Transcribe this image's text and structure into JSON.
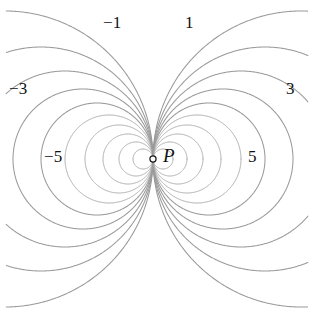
{
  "figure": {
    "type": "contour-diagram",
    "width": 314,
    "height": 316,
    "background_color": "#ffffff",
    "curve_color": "#9a9a9a",
    "label_color": "#111111"
  },
  "point": {
    "label": "P",
    "marker": "open-circle",
    "x": 153,
    "y": 159
  },
  "labels": [
    {
      "text": "−1",
      "x": 103,
      "y": 14,
      "name": "contour-label-neg-1"
    },
    {
      "text": "1",
      "x": 185,
      "y": 14,
      "name": "contour-label-pos-1"
    },
    {
      "text": "−3",
      "x": 9,
      "y": 80,
      "name": "contour-label-neg-3"
    },
    {
      "text": "3",
      "x": 286,
      "y": 80,
      "name": "contour-label-pos-3"
    },
    {
      "text": "−5",
      "x": 44,
      "y": 148,
      "name": "contour-label-neg-5"
    },
    {
      "text": "5",
      "x": 248,
      "y": 148,
      "name": "contour-label-pos-5"
    }
  ],
  "chart_data": {
    "type": "line",
    "title": "",
    "xlabel": "",
    "ylabel": "",
    "singular_point": {
      "label": "P",
      "x": 153,
      "y": 159
    },
    "legend_position": "inline-labels",
    "grid": false,
    "labeled_levels": [
      -1,
      1,
      -3,
      3,
      -5,
      5
    ],
    "series": [
      {
        "name": "-1",
        "side": "left",
        "value": -1,
        "radius": 148,
        "center_x": 5,
        "center_y": 159,
        "labeled": true
      },
      {
        "name": "-2",
        "side": "left",
        "value": -2,
        "radius": 112,
        "center_x": 41,
        "center_y": 159,
        "labeled": false
      },
      {
        "name": "-3",
        "side": "left",
        "value": -3,
        "radius": 88,
        "center_x": 65,
        "center_y": 159,
        "labeled": true
      },
      {
        "name": "-4",
        "side": "left",
        "value": -4,
        "radius": 70,
        "center_x": 83,
        "center_y": 159,
        "labeled": false
      },
      {
        "name": "-5",
        "side": "left",
        "value": -5,
        "radius": 56,
        "center_x": 97,
        "center_y": 159,
        "labeled": true
      },
      {
        "name": "-6",
        "side": "left",
        "value": -6,
        "radius": 44,
        "center_x": 109,
        "center_y": 159,
        "labeled": false
      },
      {
        "name": "-7",
        "side": "left",
        "value": -7,
        "radius": 34,
        "center_x": 119,
        "center_y": 159,
        "labeled": false
      },
      {
        "name": "-8",
        "side": "left",
        "value": -8,
        "radius": 25,
        "center_x": 128,
        "center_y": 159,
        "labeled": false
      },
      {
        "name": "-9",
        "side": "left",
        "value": -9,
        "radius": 17,
        "center_x": 136,
        "center_y": 159,
        "labeled": false
      },
      {
        "name": "-10",
        "side": "left",
        "value": -10,
        "radius": 10,
        "center_x": 143,
        "center_y": 159,
        "labeled": false
      },
      {
        "name": "1",
        "side": "right",
        "value": 1,
        "radius": 148,
        "center_x": 301,
        "center_y": 159,
        "labeled": true
      },
      {
        "name": "2",
        "side": "right",
        "value": 2,
        "radius": 112,
        "center_x": 265,
        "center_y": 159,
        "labeled": false
      },
      {
        "name": "3",
        "side": "right",
        "value": 3,
        "radius": 88,
        "center_x": 241,
        "center_y": 159,
        "labeled": true
      },
      {
        "name": "4",
        "side": "right",
        "value": 4,
        "radius": 70,
        "center_x": 223,
        "center_y": 159,
        "labeled": false
      },
      {
        "name": "5",
        "side": "right",
        "value": 5,
        "radius": 56,
        "center_x": 209,
        "center_y": 159,
        "labeled": true
      },
      {
        "name": "6",
        "side": "right",
        "value": 6,
        "radius": 44,
        "center_x": 197,
        "center_y": 159,
        "labeled": false
      },
      {
        "name": "7",
        "side": "right",
        "value": 7,
        "radius": 34,
        "center_x": 187,
        "center_y": 159,
        "labeled": false
      },
      {
        "name": "8",
        "side": "right",
        "value": 8,
        "radius": 25,
        "center_x": 178,
        "center_y": 159,
        "labeled": false
      },
      {
        "name": "9",
        "side": "right",
        "value": 9,
        "radius": 17,
        "center_x": 170,
        "center_y": 159,
        "labeled": false
      },
      {
        "name": "10",
        "side": "right",
        "value": 10,
        "radius": 10,
        "center_x": 163,
        "center_y": 159,
        "labeled": false
      }
    ]
  }
}
